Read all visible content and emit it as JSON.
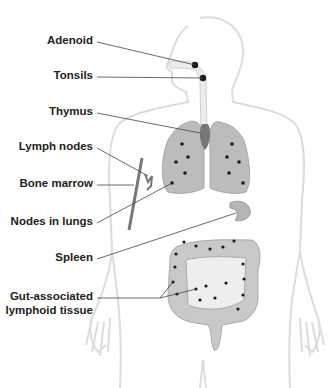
{
  "diagram": {
    "labels": [
      {
        "id": "adenoid",
        "text": "Adenoid"
      },
      {
        "id": "tonsils",
        "text": "Tonsils"
      },
      {
        "id": "thymus",
        "text": "Thymus"
      },
      {
        "id": "lymph-nodes",
        "text": "Lymph nodes"
      },
      {
        "id": "bone-marrow",
        "text": "Bone marrow"
      },
      {
        "id": "nodes-in-lungs",
        "text": "Nodes in lungs"
      },
      {
        "id": "spleen",
        "text": "Spleen"
      },
      {
        "id": "galt-line1",
        "text": "Gut-associated"
      },
      {
        "id": "galt-line2",
        "text": "lymphoid tissue"
      }
    ],
    "colors": {
      "outline": "#d8d8d8",
      "organ": "#bdbdbd",
      "organ_dark": "#7a7a7a",
      "dot": "#1a1a1a",
      "leader": "#444444",
      "text": "#222222"
    }
  }
}
